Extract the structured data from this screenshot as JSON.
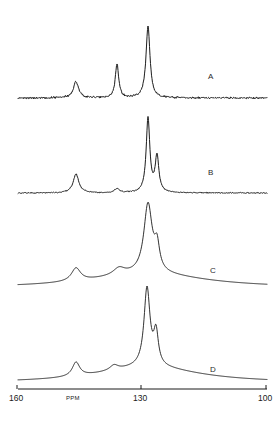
{
  "figure": {
    "type": "nmr-spectra-stack",
    "background_color": "#ffffff",
    "trace_color": "#1c1c1c",
    "axis_color": "#1a1a1a"
  },
  "axis": {
    "label": "PPM",
    "orientation": "reversed",
    "ticks": [
      {
        "value": "160",
        "ppm": 160,
        "x_px": 17
      },
      {
        "value": "130",
        "ppm": 130,
        "x_px": 141
      },
      {
        "value": "100",
        "ppm": 100,
        "x_px": 266
      }
    ],
    "range_left_ppm": 160,
    "range_right_ppm": 100,
    "baseline_y_px": 389
  },
  "traces": [
    {
      "id": "A",
      "label": "A",
      "label_x_px": 208,
      "label_y_px": 72,
      "baseline_y_px": 98,
      "linewidth": "sharp",
      "noise": "high",
      "peaks": [
        {
          "ppm": 139.5,
          "x_px": 76,
          "height_px": 16,
          "width_px": 3.2,
          "note": "minor aromatic"
        },
        {
          "ppm": 131.0,
          "x_px": 117,
          "height_px": 34,
          "width_px": 2.0,
          "note": "medium"
        },
        {
          "ppm": 128.0,
          "x_px": 148,
          "height_px": 72,
          "width_px": 2.4,
          "note": "main"
        }
      ]
    },
    {
      "id": "B",
      "label": "B",
      "label_x_px": 208,
      "label_y_px": 168,
      "baseline_y_px": 193,
      "linewidth": "sharp",
      "noise": "low",
      "peaks": [
        {
          "ppm": 139.5,
          "x_px": 76,
          "height_px": 19,
          "width_px": 3.4,
          "note": "minor aromatic"
        },
        {
          "ppm": 131.0,
          "x_px": 117,
          "height_px": 4,
          "width_px": 3.0,
          "note": "small bump"
        },
        {
          "ppm": 128.0,
          "x_px": 148,
          "height_px": 74,
          "width_px": 2.2,
          "note": "main"
        },
        {
          "ppm": 125.8,
          "x_px": 157,
          "height_px": 36,
          "width_px": 2.2,
          "note": "shoulder peak"
        }
      ]
    },
    {
      "id": "C",
      "label": "C",
      "label_x_px": 210,
      "label_y_px": 266,
      "baseline_y_px": 288,
      "linewidth": "broad",
      "noise": "none",
      "peaks": [
        {
          "ppm": 139.5,
          "x_px": 76,
          "height_px": 13,
          "width_px": 5.5,
          "note": "minor aromatic"
        },
        {
          "ppm": 130.7,
          "x_px": 119,
          "height_px": 7,
          "width_px": 7.0,
          "note": "broad shoulder"
        },
        {
          "ppm": 128.0,
          "x_px": 148,
          "height_px": 69,
          "width_px": 5.0,
          "note": "main broad"
        },
        {
          "ppm": 125.8,
          "x_px": 157,
          "height_px": 24,
          "width_px": 3.0,
          "note": "shoulder peak"
        }
      ],
      "broad_envelope": {
        "center_ppm": 128.5,
        "width_px": 70,
        "height_px": 14
      }
    },
    {
      "id": "D",
      "label": "D",
      "label_x_px": 210,
      "label_y_px": 365,
      "baseline_y_px": 383,
      "linewidth": "broad",
      "noise": "none",
      "peaks": [
        {
          "ppm": 139.5,
          "x_px": 76,
          "height_px": 14,
          "width_px": 4.5,
          "note": "minor aromatic"
        },
        {
          "ppm": 131.5,
          "x_px": 114,
          "height_px": 5,
          "width_px": 5.0,
          "note": "small bump"
        },
        {
          "ppm": 128.2,
          "x_px": 147,
          "height_px": 78,
          "width_px": 3.6,
          "note": "main broad"
        },
        {
          "ppm": 126.0,
          "x_px": 156,
          "height_px": 32,
          "width_px": 2.8,
          "note": "shoulder peak"
        }
      ],
      "broad_envelope": {
        "center_ppm": 129.0,
        "width_px": 62,
        "height_px": 16
      }
    }
  ],
  "chart_data": {
    "type": "line",
    "title": "",
    "xlabel": "PPM",
    "ylabel": "",
    "xlim": [
      160,
      100
    ],
    "grid": false,
    "legend": [
      "A",
      "B",
      "C",
      "D"
    ],
    "legend_position": "inline-right",
    "series": [
      {
        "name": "A",
        "peak_ppm": [
          139.5,
          131.0,
          128.0
        ],
        "peak_relative_intensity": [
          22,
          47,
          100
        ]
      },
      {
        "name": "B",
        "peak_ppm": [
          139.5,
          131.0,
          128.0,
          125.8
        ],
        "peak_relative_intensity": [
          26,
          5,
          100,
          49
        ]
      },
      {
        "name": "C",
        "peak_ppm": [
          139.5,
          130.7,
          128.0,
          125.8
        ],
        "peak_relative_intensity": [
          19,
          10,
          100,
          35
        ]
      },
      {
        "name": "D",
        "peak_ppm": [
          139.5,
          131.5,
          128.2,
          126.0
        ],
        "peak_relative_intensity": [
          18,
          6,
          100,
          41
        ]
      }
    ]
  }
}
